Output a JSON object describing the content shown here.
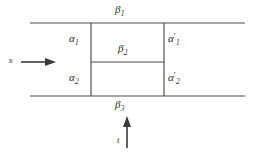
{
  "figure": {
    "type": "line-diagram",
    "background_color": "#ffffff",
    "line_color": "#4a4a4a",
    "text_color": "#2b2b2b",
    "labels": {
      "beta1": {
        "base": "β",
        "sub": "1"
      },
      "beta2": {
        "base": "β",
        "sub": "2"
      },
      "beta3": {
        "base": "β",
        "sub": "3"
      },
      "alpha1": {
        "base": "α",
        "sub": "1"
      },
      "alpha2": {
        "base": "α",
        "sub": "2"
      },
      "alpha1_prime": {
        "base": "α",
        "prime": "′",
        "sub": "1"
      },
      "alpha2_prime": {
        "base": "α",
        "prime": "′",
        "sub": "2"
      },
      "s": "s",
      "t": "t"
    },
    "arrows": [
      {
        "name": "s-arrow",
        "direction": "right",
        "label": "s"
      },
      {
        "name": "t-arrow",
        "direction": "up",
        "label": "t"
      }
    ],
    "lines": {
      "top_horizontal": {
        "x1": 30,
        "y1": 23,
        "x2": 245,
        "y2": 23
      },
      "bottom_horizontal": {
        "x1": 30,
        "y1": 96,
        "x2": 245,
        "y2": 96
      },
      "middle_horizontal": {
        "x1": 91,
        "y1": 62,
        "x2": 164,
        "y2": 62
      },
      "left_vertical": {
        "x1": 91,
        "y1": 23,
        "x2": 91,
        "y2": 96
      },
      "right_vertical": {
        "x1": 164,
        "y1": 23,
        "x2": 164,
        "y2": 96
      }
    }
  }
}
